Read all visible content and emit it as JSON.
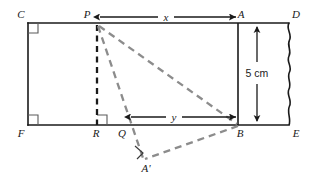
{
  "diagram": {
    "colors": {
      "solid_stroke": "#1a1a1a",
      "dashed_gray": "#8c8c8c",
      "dashed_black": "#1a1a1a",
      "background": "#ffffff",
      "label_text": "#1a1a1a"
    },
    "vertex_labels": {
      "C": "C",
      "D": "D",
      "F": "F",
      "E": "E",
      "P": "P",
      "A": "A",
      "R": "R",
      "Q": "Q",
      "B": "B",
      "A_prime": "A'"
    },
    "dimension_labels": {
      "x": "x",
      "y": "y",
      "height": "5 cm"
    },
    "icons": {
      "right_angle_marker": "right-angle-marker",
      "arrow_head": "arrow-head",
      "torn_edge": "wavy-torn-edge"
    }
  }
}
